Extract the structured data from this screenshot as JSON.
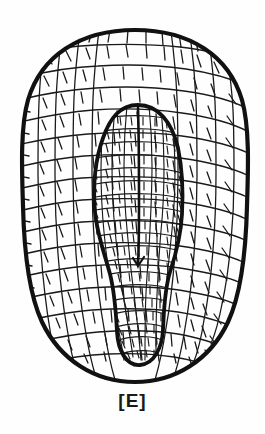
{
  "figure": {
    "domain": "scientific-illustration",
    "caption_label": "[E]",
    "background_color": "#fefefe",
    "ink_color": "#111111",
    "cell_line_color": "#1a1a1a",
    "outer_outline_width_px": 4.0,
    "inner_outline_width_px": 3.6,
    "cell_line_width_px": 1.25,
    "midline_width_px": 2.4,
    "canvas": {
      "width": 265,
      "height": 434
    },
    "outer_body": {
      "name": "seed-outline",
      "shape": "ovate",
      "bbox": {
        "x": 22,
        "y": 30,
        "width": 226,
        "height": 352
      },
      "center_x": 135,
      "center_y": 206
    },
    "inner_body": {
      "name": "hilum-region-outline",
      "shape": "elongate-teardrop",
      "bbox": {
        "x": 93,
        "y": 105,
        "width": 90,
        "height": 260
      },
      "apex_y": 105,
      "widest_y": 205,
      "waist_y": 285,
      "tip_y": 365
    },
    "midline": {
      "name": "raphe-midline",
      "x": 138,
      "top_y": 108,
      "bottom_y": 266,
      "terminal_marker": "small-notch"
    },
    "cell_network": {
      "description": "reticulate polygonal epidermal cells",
      "outer_cell_size_px": 16,
      "inner_cell_size_px": 10
    }
  }
}
